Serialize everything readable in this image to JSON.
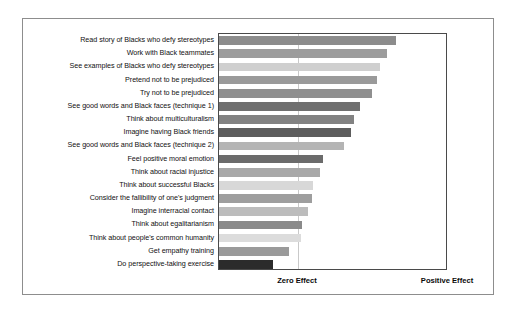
{
  "chart_data": {
    "type": "bar",
    "orientation": "horizontal",
    "title": "",
    "subtitle": "",
    "xlabel": "",
    "ylabel": "",
    "grid": false,
    "legend": null,
    "axis_annotations": [
      {
        "name": "zero-effect",
        "label": "Zero Effect",
        "position_value": 0
      },
      {
        "name": "positive-effect",
        "label": "Positive Effect",
        "position_value": 100
      }
    ],
    "xlim": [
      -53,
      100
    ],
    "zero_line": true,
    "categories": [
      "Read story of Blacks who defy stereotypes",
      "Work with Black teammates",
      "See examples of Blacks who defy stereotypes",
      "Pretend not to be prejudiced",
      "Try not to be prejudiced",
      "See good words and Black faces (technique 1)",
      "Think about multiculturalism",
      "Imagine having Black friends",
      "See good words and Black faces (technique 2)",
      "Feel positive moral emotion",
      "Think about racial injustice",
      "Think about successful Blacks",
      "Consider the fallibility of one's judgment",
      "Imagine interracial contact",
      "Think about egalitarianism",
      "Think about people's common humanity",
      "Get empathy training",
      "Do perspective-taking exercise"
    ],
    "values": [
      65.5,
      59.5,
      54.5,
      52.5,
      49.5,
      41.0,
      37.0,
      35.5,
      30.5,
      16.5,
      14.5,
      10.0,
      9.0,
      6.5,
      2.5,
      1.5,
      -6.5,
      -17.0
    ],
    "bar_colors": [
      "#8c8c8c",
      "#9c9c9c",
      "#cfcfcf",
      "#9a9a9a",
      "#8f8f8f",
      "#6f6f6f",
      "#828282",
      "#5d5d5d",
      "#b4b4b4",
      "#6b6b6b",
      "#a8a8a8",
      "#d8d8d8",
      "#9e9e9e",
      "#bcbcbc",
      "#8a8a8a",
      "#dcdcdc",
      "#9a9a9a",
      "#2b2b2b"
    ]
  },
  "style": {
    "plot_border_color": "#4a4a4a",
    "outer_frame_color": "#8d8d8d",
    "zero_line_color": "#c9c9c9",
    "background": "#ffffff",
    "text_color": "#111111"
  }
}
